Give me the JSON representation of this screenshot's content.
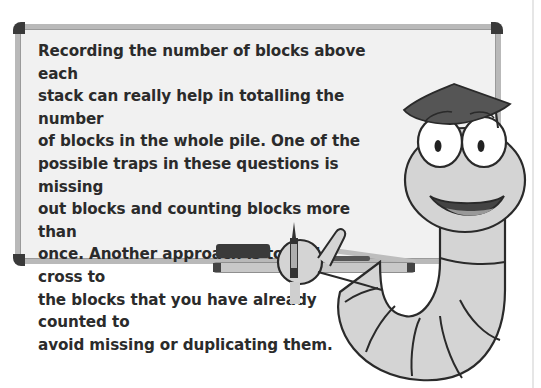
{
  "tip": {
    "lines": [
      "Recording the number of blocks above each",
      "stack can really help in totalling the number",
      "of blocks in the whole pile. One of the",
      "possible traps in these questions is missing",
      "out blocks and counting blocks more than",
      "once. Another approach is to add a cross to",
      "the blocks that you have already counted to",
      "avoid missing or duplicating them."
    ]
  },
  "colors": {
    "board_surface": "#f1f1f1",
    "frame": "#b9b9b9",
    "corner": "#3a3a3a",
    "text": "#2b2b2b",
    "worm_body": "#d4d4d4",
    "outline": "#2a2a2a"
  },
  "illustration": {
    "character": "worm-with-graduation-cap",
    "holding": "marker-pen"
  }
}
